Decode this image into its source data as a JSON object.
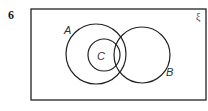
{
  "question": {
    "number": "6"
  },
  "diagram": {
    "type": "venn",
    "universal_symbol": "ξ",
    "sets": [
      {
        "label": "A",
        "cx": 96,
        "cy": 54,
        "r": 30
      },
      {
        "label": "B",
        "cx": 142,
        "cy": 55,
        "r": 28
      },
      {
        "label": "C",
        "cx": 104,
        "cy": 55,
        "r": 16
      }
    ],
    "relationships": [
      "C is a subset of A",
      "C intersects B",
      "A intersects B"
    ],
    "stroke_color": "#222222"
  }
}
